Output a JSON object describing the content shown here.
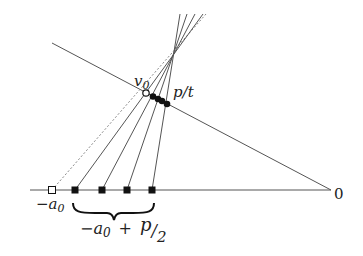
{
  "diagram": {
    "labels": {
      "v0": "v",
      "v0_sub": "0",
      "pt": "p/t",
      "neg_a0": "−a",
      "neg_a0_sub": "0",
      "zero": "0",
      "brace_expr_a": "−a",
      "brace_expr_a_sub": "0",
      "brace_expr_plus": "+",
      "brace_expr_p": "p",
      "brace_expr_slash": "/",
      "brace_expr_2": "2"
    },
    "colors": {
      "line": "#555555",
      "point_fill": "#111111",
      "background": "#ffffff"
    },
    "axis_squares_x": [
      52,
      75,
      102,
      127,
      152
    ],
    "upper_points": [
      {
        "x": 146,
        "y": 93,
        "open": true
      },
      {
        "x": 153,
        "y": 96,
        "open": false
      },
      {
        "x": 158,
        "y": 99,
        "open": false
      },
      {
        "x": 162,
        "y": 101,
        "open": false
      },
      {
        "x": 167,
        "y": 104,
        "open": false
      }
    ]
  }
}
